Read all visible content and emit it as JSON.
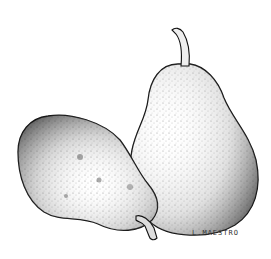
{
  "illustration": {
    "subject": "two-pears-stipple-drawing",
    "signature": "L.MAESTRO",
    "colors": {
      "ink": "#111111",
      "paper": "#ffffff"
    }
  }
}
